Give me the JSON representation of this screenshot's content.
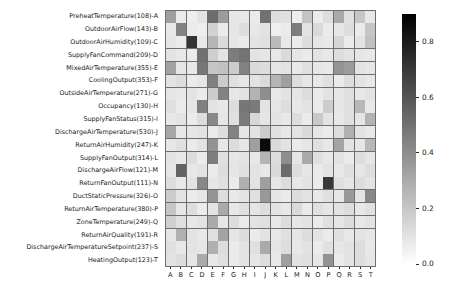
{
  "chart_data": {
    "type": "heatmap",
    "title": "",
    "xlabel": "",
    "ylabel": "",
    "grid": true,
    "colormap": "greys",
    "cmap_low_color": "#ffffff",
    "cmap_high_color": "#000000",
    "colorbar": {
      "position": "right",
      "vmin": 0.0,
      "vmax": 0.9,
      "ticks": [
        0.0,
        0.2,
        0.4,
        0.6,
        0.8
      ],
      "tick_labels": [
        "0.0",
        "0.2",
        "0.4",
        "0.6",
        "0.8"
      ]
    },
    "row_labels": [
      "PreheatTemperature(108)-A",
      "OutdoorAirFlow(143)-B",
      "OutdoorAirHumidity(109)-C",
      "SupplyFanCommand(209)-D",
      "MixedAirTemperature(355)-E",
      "CoolingOutput(353)-F",
      "OutsideAirTemperature(271)-G",
      "Occupancy(130)-H",
      "SupplyFanStatus(315)-I",
      "DischargeAirTemperature(530)-J",
      "ReturnAirHumidity(247)-K",
      "SupplyFanOutput(314)-L",
      "DischargeAirFlow(121)-M",
      "ReturnFanOutput(111)-N",
      "DuctStaticPressure(326)-O",
      "ReturnAirTemperature(380)-P",
      "ZoneTemperature(249)-Q",
      "ReturnAirQuality(191)-R",
      "DischargeAirTemperatureSetpoint(237)-S",
      "HeatingOutput(123)-T"
    ],
    "column_labels": [
      "A",
      "B",
      "C",
      "D",
      "E",
      "F",
      "G",
      "H",
      "I",
      "J",
      "K",
      "L",
      "M",
      "N",
      "O",
      "P",
      "Q",
      "R",
      "S",
      "T"
    ],
    "values": [
      [
        0.34,
        0.07,
        0.06,
        0.1,
        0.52,
        0.35,
        0.09,
        0.08,
        0.07,
        0.5,
        0.12,
        0.11,
        0.06,
        0.21,
        0.07,
        0.12,
        0.3,
        0.11,
        0.2,
        0.08
      ],
      [
        0.08,
        0.44,
        0.07,
        0.06,
        0.16,
        0.07,
        0.09,
        0.12,
        0.08,
        0.1,
        0.06,
        0.07,
        0.46,
        0.1,
        0.13,
        0.07,
        0.09,
        0.12,
        0.07,
        0.2
      ],
      [
        0.09,
        0.07,
        0.72,
        0.08,
        0.26,
        0.13,
        0.09,
        0.07,
        0.1,
        0.11,
        0.24,
        0.08,
        0.07,
        0.12,
        0.09,
        0.08,
        0.15,
        0.07,
        0.1,
        0.22
      ],
      [
        0.1,
        0.08,
        0.07,
        0.5,
        0.17,
        0.1,
        0.46,
        0.49,
        0.1,
        0.09,
        0.08,
        0.13,
        0.09,
        0.07,
        0.1,
        0.08,
        0.12,
        0.1,
        0.09,
        0.08
      ],
      [
        0.33,
        0.09,
        0.08,
        0.48,
        0.2,
        0.22,
        0.18,
        0.44,
        0.13,
        0.12,
        0.09,
        0.1,
        0.08,
        0.11,
        0.09,
        0.08,
        0.38,
        0.35,
        0.1,
        0.09
      ],
      [
        0.1,
        0.12,
        0.07,
        0.09,
        0.45,
        0.18,
        0.11,
        0.09,
        0.1,
        0.13,
        0.26,
        0.34,
        0.12,
        0.09,
        0.08,
        0.11,
        0.07,
        0.12,
        0.1,
        0.08
      ],
      [
        0.09,
        0.08,
        0.1,
        0.07,
        0.18,
        0.44,
        0.09,
        0.1,
        0.27,
        0.4,
        0.08,
        0.1,
        0.09,
        0.12,
        0.07,
        0.1,
        0.09,
        0.11,
        0.08,
        0.1
      ],
      [
        0.11,
        0.07,
        0.09,
        0.45,
        0.1,
        0.08,
        0.12,
        0.48,
        0.47,
        0.1,
        0.09,
        0.12,
        0.08,
        0.1,
        0.07,
        0.18,
        0.09,
        0.11,
        0.25,
        0.08
      ],
      [
        0.08,
        0.1,
        0.07,
        0.12,
        0.42,
        0.09,
        0.11,
        0.47,
        0.14,
        0.09,
        0.1,
        0.08,
        0.12,
        0.07,
        0.19,
        0.1,
        0.08,
        0.11,
        0.09,
        0.27
      ],
      [
        0.31,
        0.08,
        0.09,
        0.1,
        0.07,
        0.12,
        0.44,
        0.09,
        0.1,
        0.18,
        0.11,
        0.08,
        0.1,
        0.13,
        0.09,
        0.07,
        0.12,
        0.28,
        0.1,
        0.08
      ],
      [
        0.09,
        0.11,
        0.07,
        0.1,
        0.38,
        0.08,
        0.12,
        0.09,
        0.34,
        0.86,
        0.13,
        0.1,
        0.07,
        0.09,
        0.11,
        0.08,
        0.32,
        0.1,
        0.09,
        0.25
      ],
      [
        0.1,
        0.08,
        0.12,
        0.07,
        0.46,
        0.11,
        0.09,
        0.1,
        0.08,
        0.26,
        0.12,
        0.4,
        0.09,
        0.3,
        0.11,
        0.08,
        0.1,
        0.07,
        0.12,
        0.09
      ],
      [
        0.09,
        0.55,
        0.08,
        0.1,
        0.07,
        0.12,
        0.09,
        0.11,
        0.1,
        0.08,
        0.13,
        0.52,
        0.12,
        0.09,
        0.07,
        0.1,
        0.08,
        0.11,
        0.09,
        0.12
      ],
      [
        0.12,
        0.08,
        0.1,
        0.42,
        0.09,
        0.11,
        0.07,
        0.28,
        0.1,
        0.34,
        0.09,
        0.12,
        0.08,
        0.1,
        0.07,
        0.7,
        0.11,
        0.09,
        0.12,
        0.1
      ],
      [
        0.18,
        0.1,
        0.07,
        0.09,
        0.38,
        0.12,
        0.08,
        0.1,
        0.11,
        0.36,
        0.09,
        0.07,
        0.12,
        0.1,
        0.08,
        0.11,
        0.09,
        0.36,
        0.1,
        0.42
      ],
      [
        0.2,
        0.09,
        0.12,
        0.07,
        0.1,
        0.3,
        0.08,
        0.11,
        0.09,
        0.12,
        0.1,
        0.08,
        0.13,
        0.07,
        0.11,
        0.09,
        0.1,
        0.12,
        0.08,
        0.11
      ],
      [
        0.17,
        0.11,
        0.08,
        0.1,
        0.3,
        0.09,
        0.12,
        0.07,
        0.1,
        0.11,
        0.08,
        0.12,
        0.09,
        0.1,
        0.07,
        0.11,
        0.09,
        0.12,
        0.08,
        0.1
      ],
      [
        0.09,
        0.28,
        0.1,
        0.08,
        0.11,
        0.32,
        0.09,
        0.12,
        0.07,
        0.1,
        0.08,
        0.11,
        0.09,
        0.12,
        0.1,
        0.07,
        0.11,
        0.08,
        0.1,
        0.09
      ],
      [
        0.11,
        0.08,
        0.1,
        0.09,
        0.28,
        0.12,
        0.07,
        0.1,
        0.11,
        0.3,
        0.09,
        0.12,
        0.08,
        0.1,
        0.07,
        0.11,
        0.09,
        0.1,
        0.12,
        0.08
      ],
      [
        0.1,
        0.12,
        0.09,
        0.3,
        0.08,
        0.11,
        0.07,
        0.1,
        0.09,
        0.12,
        0.08,
        0.34,
        0.1,
        0.11,
        0.09,
        0.38,
        0.07,
        0.1,
        0.12,
        0.09
      ]
    ]
  }
}
